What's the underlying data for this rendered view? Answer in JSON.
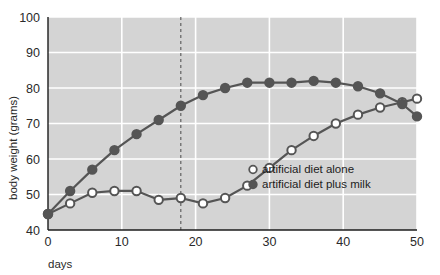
{
  "chart_data": {
    "type": "line",
    "title": "",
    "xlabel": "days",
    "ylabel": "body weight (grams)",
    "xlim": [
      0,
      50
    ],
    "ylim": [
      40,
      100
    ],
    "xticks": [
      "0",
      "10",
      "20",
      "30",
      "40",
      "50"
    ],
    "xtick_values": [
      0,
      10,
      20,
      30,
      40,
      50
    ],
    "yticks": [
      "40",
      "50",
      "60",
      "70",
      "80",
      "90",
      "100"
    ],
    "ytick_values": [
      40,
      50,
      60,
      70,
      80,
      90,
      100
    ],
    "grid": true,
    "grid_color": "#ffffff",
    "plot_background": "#d4d4d4",
    "legend_position": "center-right",
    "annotations": [
      {
        "name": "vertical-dashed-line",
        "type": "vline",
        "x": 18,
        "style": "dashed",
        "color": "#4a4a4a"
      }
    ],
    "x": [
      0,
      3,
      6,
      9,
      12,
      15,
      18,
      21,
      24,
      27,
      30,
      33,
      36,
      39,
      42,
      45,
      48,
      50
    ],
    "series": [
      {
        "name": "artificial diet alone",
        "marker": "open-circle",
        "color": "#555555",
        "marker_fill": "#ffffff",
        "values": [
          44.5,
          47.5,
          50.5,
          51.0,
          51.0,
          48.5,
          49.0,
          47.5,
          49.0,
          52.5,
          57.5,
          62.5,
          66.5,
          70.0,
          72.5,
          74.5,
          76.0,
          77.0
        ]
      },
      {
        "name": "artificial diet plus milk",
        "marker": "filled-circle",
        "color": "#555555",
        "marker_fill": "#555555",
        "values": [
          44.5,
          51.0,
          57.0,
          62.5,
          67.0,
          71.0,
          75.0,
          78.0,
          80.0,
          81.5,
          81.5,
          81.5,
          82.0,
          81.5,
          80.5,
          78.5,
          75.5,
          72.0
        ]
      }
    ]
  },
  "legend": {
    "items": [
      {
        "label": "artificial diet alone",
        "marker": "open-circle"
      },
      {
        "label": "artificial diet plus milk",
        "marker": "filled-circle"
      }
    ]
  }
}
